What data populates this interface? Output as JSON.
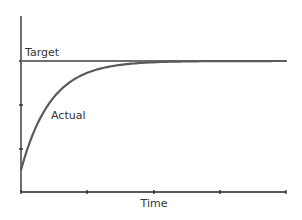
{
  "chart_data": {
    "type": "line",
    "title": "",
    "xlabel": "Time",
    "ylabel": "",
    "grid": false,
    "legend": null,
    "x_ticks": 5,
    "y_ticks": [
      0,
      1,
      2,
      3
    ],
    "annotations": [
      {
        "text": "Target",
        "target": "target-series"
      },
      {
        "text": "Actual",
        "target": "actual-series"
      }
    ],
    "series": [
      {
        "name": "Target",
        "kind": "constant",
        "value": 1.0,
        "color": "#707070"
      },
      {
        "name": "Actual",
        "kind": "first-order-step-response",
        "start": 0.2,
        "final": 1.0,
        "time_constant": 0.45,
        "color": "#5a5a5a"
      }
    ],
    "xlim": [
      0,
      4
    ],
    "ylim": [
      0,
      1.2
    ]
  },
  "labels": {
    "target": "Target",
    "actual": "Actual",
    "xaxis": "Time"
  },
  "colors": {
    "axis": "#222222",
    "target_line": "#707070",
    "actual_line": "#5a5a5a",
    "text": "#333333",
    "background": "#ffffff"
  }
}
